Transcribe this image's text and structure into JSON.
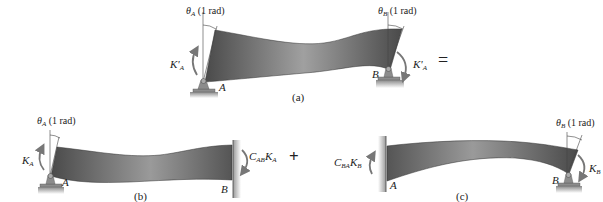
{
  "figure": {
    "panels": [
      {
        "id": "a",
        "caption": "(a)",
        "theta_left": {
          "symbol": "θ",
          "sub": "A",
          "text": " (1 rad)"
        },
        "theta_right": {
          "symbol": "θ",
          "sub": "B",
          "text": " (1 rad)"
        },
        "moment_left": {
          "symbol": "K'",
          "sub": "A"
        },
        "moment_right": {
          "symbol": "K'",
          "sub": "A"
        },
        "support_left": "A",
        "support_right": "B",
        "operator": "="
      },
      {
        "id": "b",
        "caption": "(b)",
        "theta_left": {
          "symbol": "θ",
          "sub": "A",
          "text": " (1 rad)"
        },
        "moment_left": {
          "symbol": "K",
          "sub": "A"
        },
        "moment_right": {
          "symbol": "C",
          "sub": "AB",
          "symbol2": "K",
          "sub2": "A"
        },
        "support_left": "A",
        "support_right": "B",
        "operator": "+"
      },
      {
        "id": "c",
        "caption": "(c)",
        "theta_right": {
          "symbol": "θ",
          "sub": "B",
          "text": " (1 rad)"
        },
        "moment_left": {
          "symbol": "C",
          "sub": "BA",
          "symbol2": "K",
          "sub2": "B"
        },
        "moment_right": {
          "symbol": "K",
          "sub": "B"
        },
        "support_left": "A",
        "support_right": "B"
      }
    ],
    "colors": {
      "beam_dark": "#4a4a4a",
      "beam_light": "#a8a8a8",
      "support": "#8c8c8c",
      "text": "#222222",
      "wall": "#bbbbbb"
    }
  }
}
